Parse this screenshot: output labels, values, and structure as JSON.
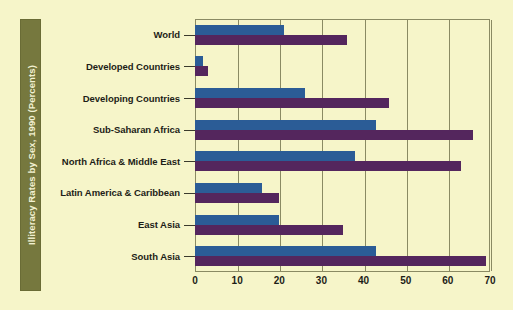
{
  "chart_data": {
    "type": "bar",
    "orientation": "horizontal",
    "title": "Illiteracy Rates by Sex, 1990 (Percents)",
    "xlabel": "",
    "ylabel": "",
    "xlim": [
      0,
      70
    ],
    "xticks": [
      0,
      10,
      20,
      30,
      40,
      50,
      60,
      70
    ],
    "xtick_labels": [
      "0",
      "10",
      "20",
      "30",
      "40",
      "50",
      "60",
      "70"
    ],
    "grid": true,
    "legend": false,
    "categories": [
      "World",
      "Developed Countries",
      "Developing Countries",
      "Sub-Saharan Africa",
      "North Africa & Middle East",
      "Latin America & Caribbean",
      "East Asia",
      "South Asia"
    ],
    "series": [
      {
        "name": "Male",
        "color": "#2b5c96",
        "values": [
          21,
          2,
          26,
          43,
          38,
          16,
          20,
          43
        ]
      },
      {
        "name": "Female",
        "color": "#54265d",
        "values": [
          36,
          3,
          46,
          66,
          63,
          20,
          35,
          69
        ]
      }
    ]
  },
  "colors": {
    "background": "#f6f5c9",
    "title_band": "#76783e",
    "title_text": "#f2f1d2",
    "frame": "#8a8a63",
    "male_bar": "#2b5c96",
    "female_bar": "#54265d",
    "axis_text": "#1d1d17"
  }
}
